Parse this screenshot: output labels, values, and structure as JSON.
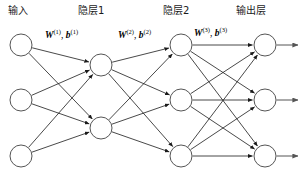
{
  "diagram": {
    "background_color": "#ffffff",
    "node_stroke_color": "#555555",
    "edge_color": "#1a1a1a",
    "layer_titles": [
      {
        "id": "input",
        "label": "输入",
        "x": 8,
        "y": 6
      },
      {
        "id": "hidden1",
        "label": "隐层1",
        "x": 78,
        "y": 6
      },
      {
        "id": "hidden2",
        "label": "隐层2",
        "x": 163,
        "y": 6
      },
      {
        "id": "output",
        "label": "输出层",
        "x": 236,
        "y": 6
      }
    ],
    "param_labels": [
      {
        "id": "w1b1",
        "w": "W",
        "w_sup": "(1)",
        "sep": ", ",
        "b": "b",
        "b_sup": "(1)",
        "x": 45,
        "y": 29
      },
      {
        "id": "w2b2",
        "w": "W",
        "w_sup": "(2)",
        "sep": ", ",
        "b": "b",
        "b_sup": "(2)",
        "x": 118,
        "y": 29
      },
      {
        "id": "w3b3",
        "w": "W",
        "w_sup": "(3)",
        "sep": ", ",
        "b": "b",
        "b_sup": "(3)",
        "x": 194,
        "y": 27
      }
    ],
    "layers": [
      {
        "id": "input",
        "name": "input-layer",
        "node_count": 3,
        "x": 21,
        "radius": 11,
        "nodes_y": [
          45,
          100,
          156
        ]
      },
      {
        "id": "hidden1",
        "name": "hidden-layer-1",
        "node_count": 2,
        "x": 101,
        "radius": 11,
        "nodes_y": [
          65,
          128
        ]
      },
      {
        "id": "hidden2",
        "name": "hidden-layer-2",
        "node_count": 3,
        "x": 181,
        "radius": 11,
        "nodes_y": [
          45,
          100,
          156
        ]
      },
      {
        "id": "output",
        "name": "output-layer",
        "node_count": 3,
        "x": 265,
        "radius": 11,
        "nodes_y": [
          45,
          100,
          156
        ]
      }
    ],
    "connections": [
      {
        "from": "input",
        "to": "hidden1",
        "type": "fully-connected",
        "arrowheads": true
      },
      {
        "from": "hidden1",
        "to": "hidden2",
        "type": "fully-connected",
        "arrowheads": true
      },
      {
        "from": "hidden2",
        "to": "output",
        "type": "fully-connected",
        "arrowheads": true
      }
    ],
    "output_arrows": {
      "count": 3,
      "length": 22,
      "arrowheads": true
    }
  }
}
